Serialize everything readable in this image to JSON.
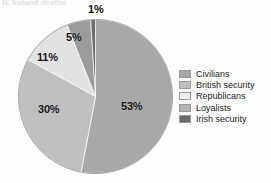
{
  "title_remnant": "N. Ireland deaths",
  "chart_data": {
    "type": "pie",
    "title": "",
    "categories": [
      "Civilians",
      "British security",
      "Republicans",
      "Loyalists",
      "Irish security"
    ],
    "values": [
      53,
      30,
      11,
      5,
      1
    ],
    "unit": "%",
    "labels": [
      "53%",
      "30%",
      "11%",
      "5%",
      "1%"
    ],
    "colors": [
      "#a8a8a8",
      "#c0c0c0",
      "#e2e2e2",
      "#9b9b9b",
      "#6b6b6b"
    ],
    "legend_position": "right",
    "grid": false,
    "start_angle_deg": 0,
    "direction": "clockwise"
  },
  "slice_labels": [
    {
      "text": "53%",
      "left": 121,
      "top": 100
    },
    {
      "text": "30%",
      "left": 38,
      "top": 103
    },
    {
      "text": "11%",
      "left": 37,
      "top": 51
    },
    {
      "text": "5%",
      "left": 66,
      "top": 31
    },
    {
      "text": "1%",
      "left": 88,
      "top": 3
    }
  ],
  "legend": {
    "items": [
      {
        "label": "Civilians",
        "color": "#a8a8a8"
      },
      {
        "label": "British security",
        "color": "#c0c0c0"
      },
      {
        "label": "Republicans",
        "color": "#eeeeee"
      },
      {
        "label": "Loyalists",
        "color": "#b4b4b4"
      },
      {
        "label": "Irish security",
        "color": "#6b6b6b"
      }
    ]
  }
}
